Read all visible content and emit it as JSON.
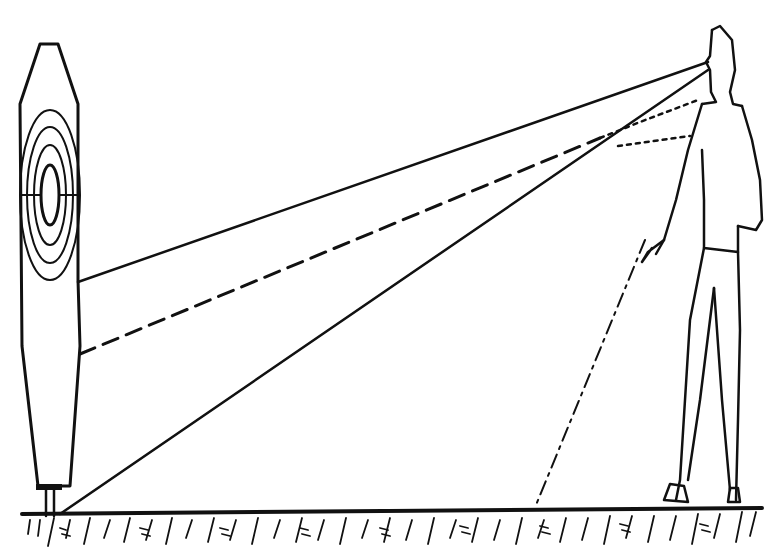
{
  "figure": {
    "elements": {
      "target": {
        "type": "silhouette-target",
        "ring_labels": [
          "7",
          "8",
          "9",
          "10",
          "9",
          "8",
          "7"
        ]
      },
      "shooter": {
        "type": "standing-man",
        "holding": "pistol"
      },
      "lines": [
        {
          "name": "eye-to-target-upper",
          "style": "solid"
        },
        {
          "name": "aim-line",
          "style": "dashed"
        },
        {
          "name": "eye-to-target-base",
          "style": "solid"
        },
        {
          "name": "pistol-down-line",
          "style": "dash-dot"
        }
      ],
      "ground": {
        "type": "hatched-ground"
      }
    },
    "colors": {
      "ink": "#111111",
      "background": "#ffffff"
    }
  }
}
